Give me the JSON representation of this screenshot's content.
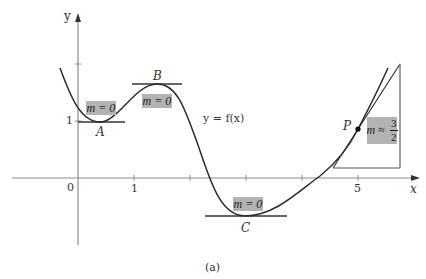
{
  "figure": {
    "caption": "(a)",
    "curve_label": "y = f(x)",
    "colors": {
      "axis": "#8c8c8c",
      "curve": "#2b2b2b",
      "tangent": "#333333",
      "highlight_box": "#b3b3b3",
      "point": "#000000"
    },
    "axes": {
      "x_label": "x",
      "y_label": "y",
      "origin_label": "0",
      "x_tick_labels": [
        {
          "value": "1",
          "position": 1
        },
        {
          "value": "5",
          "position": 5
        }
      ],
      "x_ticks": [
        1,
        2,
        3,
        4,
        5
      ],
      "y_tick_labels": [
        {
          "value": "1",
          "position": 1
        }
      ],
      "y_ticks": [
        1,
        2
      ]
    },
    "points": [
      {
        "name": "A",
        "kind": "local minimum",
        "slope_label": "m = 0"
      },
      {
        "name": "B",
        "kind": "local maximum",
        "slope_label": "m = 0"
      },
      {
        "name": "C",
        "kind": "local minimum",
        "slope_label": "m = 0"
      },
      {
        "name": "P",
        "kind": "point on curve",
        "slope_label_prefix": "m ≈",
        "slope_numerator": "3",
        "slope_denominator": "2"
      }
    ]
  }
}
